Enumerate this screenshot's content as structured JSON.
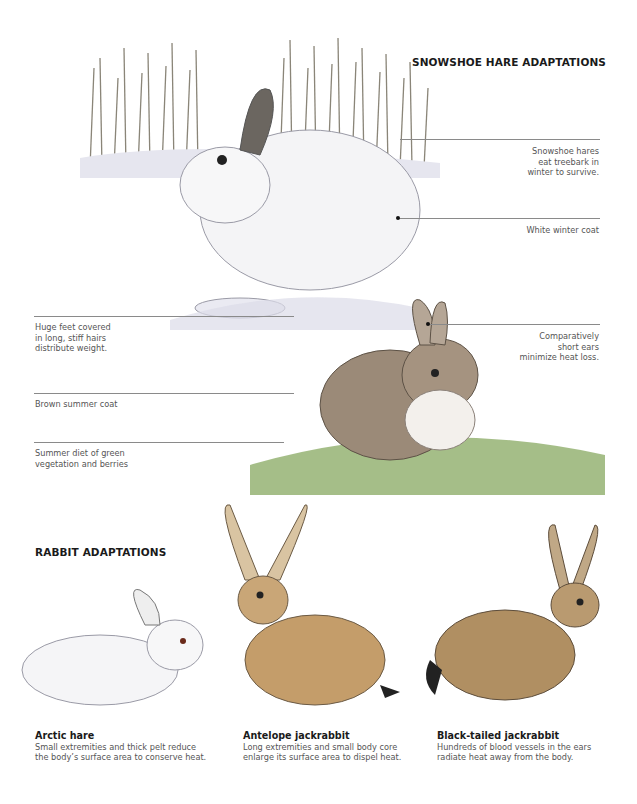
{
  "snowshoe": {
    "title": "SNOWSHOE HARE ADAPTATIONS",
    "labels": [
      {
        "id": "treebark",
        "lines": [
          "Snowshoe hares",
          "eat treebark in",
          "winter to survive."
        ]
      },
      {
        "id": "winter-coat",
        "lines": [
          "White winter coat"
        ]
      },
      {
        "id": "feet",
        "lines": [
          "Huge feet covered",
          "in long, stiff hairs",
          "distribute weight."
        ]
      },
      {
        "id": "ears",
        "lines": [
          "Comparatively",
          "short ears",
          "minimize heat loss."
        ]
      },
      {
        "id": "summer-coat",
        "lines": [
          "Brown summer coat"
        ]
      },
      {
        "id": "summer-diet",
        "lines": [
          "Summer diet of green",
          "vegetation and berries"
        ]
      }
    ]
  },
  "rabbits": {
    "title": "RABBIT ADAPTATIONS",
    "species": [
      {
        "name": "Arctic hare",
        "desc": [
          "Small extremities and thick pelt reduce",
          "the body’s surface area to conserve heat."
        ]
      },
      {
        "name": "Antelope jackrabbit",
        "desc": [
          "Long extremities and small body core",
          "enlarge its surface area to dispel heat."
        ]
      },
      {
        "name": "Black-tailed jackrabbit",
        "desc": [
          "Hundreds of blood vessels in the ears",
          "radiate heat away from the body."
        ]
      }
    ]
  },
  "colors": {
    "leader_line": "#8a8a8a",
    "caption": "#555555",
    "heading": "#1a1a1a"
  }
}
